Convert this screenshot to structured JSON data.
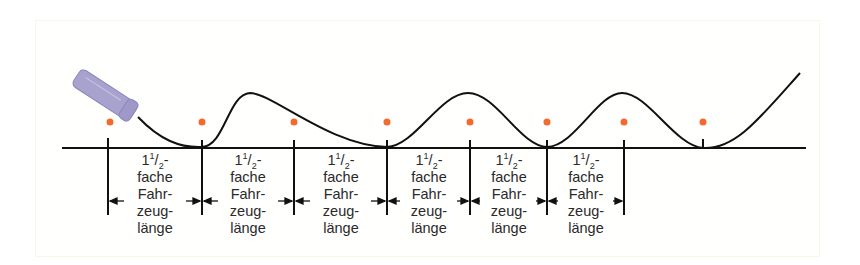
{
  "diagram": {
    "title": "",
    "colors": {
      "curve": "#111111",
      "baseline": "#111111",
      "dot": "#f26a2e",
      "tube": "#a8a2cf",
      "frame": "#f6f7e6"
    },
    "tick_x": [
      108,
      202,
      294,
      387,
      470,
      547,
      624,
      703
    ],
    "dot_x": [
      110,
      202,
      294,
      387,
      470,
      547,
      624,
      703
    ],
    "segments": [
      {
        "whole": "1",
        "num": "1",
        "den": "2",
        "dash": "-",
        "line2": "fache",
        "line3": "Fahr-",
        "line4": "zeug-",
        "line5": "länge"
      },
      {
        "whole": "1",
        "num": "1",
        "den": "2",
        "dash": "-",
        "line2": "fache",
        "line3": "Fahr-",
        "line4": "zeug-",
        "line5": "länge"
      },
      {
        "whole": "1",
        "num": "1",
        "den": "2",
        "dash": "-",
        "line2": "fache",
        "line3": "Fahr-",
        "line4": "zeug-",
        "line5": "länge"
      },
      {
        "whole": "1",
        "num": "1",
        "den": "2",
        "dash": "-",
        "line2": "fache",
        "line3": "Fahr-",
        "line4": "zeug-",
        "line5": "länge"
      },
      {
        "whole": "1",
        "num": "1",
        "den": "2",
        "dash": "-",
        "line2": "fache",
        "line3": "Fahr-",
        "line4": "zeug-",
        "line5": "länge"
      },
      {
        "whole": "1",
        "num": "1",
        "den": "2",
        "dash": "-",
        "line2": "fache",
        "line3": "Fahr-",
        "line4": "zeug-",
        "line5": "länge"
      }
    ]
  }
}
